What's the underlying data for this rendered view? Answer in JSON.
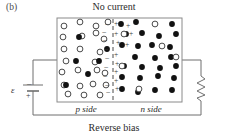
{
  "figure": {
    "panel_label": "(b)",
    "title": "No current",
    "caption": "Reverse bias",
    "p_side_label": "p side",
    "n_side_label": "n side",
    "emf_symbol": "ε",
    "emf_terminal_top": "–",
    "emf_terminal_bottom": "+",
    "colors": {
      "ink": "#231f20",
      "line": "#6f6f6f",
      "box_border": "#8a8a8a",
      "fill_circle": "#111111",
      "open_circle_stroke": "#4a4a4a",
      "background": "#ffffff"
    }
  },
  "box": {
    "x": 57,
    "y": 18,
    "width": 125,
    "height": 84,
    "junction_x": 113
  },
  "depletion": {
    "minus_sign": "–",
    "plus_sign": "+",
    "minus_positions": [
      [
        107,
        26
      ],
      [
        104,
        34
      ],
      [
        105,
        42
      ],
      [
        106,
        51
      ],
      [
        107,
        60
      ],
      [
        106,
        69
      ],
      [
        105,
        78
      ],
      [
        107,
        87
      ],
      [
        108,
        94
      ]
    ],
    "plus_positions": [
      [
        116,
        26
      ],
      [
        128,
        28
      ],
      [
        116,
        36
      ],
      [
        131,
        36
      ],
      [
        118,
        45
      ],
      [
        127,
        47
      ],
      [
        116,
        57
      ],
      [
        117,
        66
      ],
      [
        116,
        74
      ],
      [
        116,
        83
      ],
      [
        117,
        91
      ]
    ]
  },
  "p_side": {
    "open_circles": [
      [
        64,
        26
      ],
      [
        80,
        22
      ],
      [
        96,
        26
      ],
      [
        108,
        22
      ],
      [
        63,
        37
      ],
      [
        82,
        36
      ],
      [
        96,
        33
      ],
      [
        104,
        39
      ],
      [
        64,
        49
      ],
      [
        80,
        49
      ],
      [
        100,
        52
      ],
      [
        66,
        61
      ],
      [
        95,
        62
      ],
      [
        62,
        72
      ],
      [
        78,
        70
      ],
      [
        97,
        70
      ],
      [
        105,
        73
      ],
      [
        64,
        85
      ],
      [
        80,
        86
      ],
      [
        93,
        84
      ],
      [
        106,
        85
      ],
      [
        68,
        94
      ],
      [
        84,
        95
      ],
      [
        100,
        95
      ]
    ],
    "filled_circles": [
      [
        79,
        37
      ],
      [
        107,
        49
      ],
      [
        76,
        61
      ],
      [
        88,
        74
      ],
      [
        66,
        85
      ],
      [
        99,
        61
      ]
    ]
  },
  "n_side": {
    "filled_circles": [
      [
        121,
        24
      ],
      [
        136,
        22
      ],
      [
        172,
        24
      ],
      [
        126,
        34
      ],
      [
        142,
        33
      ],
      [
        159,
        36
      ],
      [
        176,
        34
      ],
      [
        122,
        45
      ],
      [
        138,
        46
      ],
      [
        152,
        45
      ],
      [
        170,
        47
      ],
      [
        135,
        57
      ],
      [
        155,
        58
      ],
      [
        171,
        57
      ],
      [
        124,
        66
      ],
      [
        142,
        67
      ],
      [
        160,
        68
      ],
      [
        176,
        66
      ],
      [
        122,
        77
      ],
      [
        140,
        78
      ],
      [
        158,
        76
      ],
      [
        174,
        78
      ],
      [
        122,
        89
      ],
      [
        138,
        92
      ],
      [
        155,
        90
      ],
      [
        172,
        90
      ]
    ],
    "open_circles": [
      [
        124,
        34
      ],
      [
        155,
        24
      ],
      [
        162,
        46
      ],
      [
        122,
        66
      ],
      [
        139,
        89
      ],
      [
        176,
        57
      ]
    ]
  },
  "circuit": {
    "left_wire_x": 33,
    "right_wire_x": 201,
    "top_wire_y": 60,
    "bottom_wire_y": 115,
    "battery_y": 88,
    "resistor_name": "resistor",
    "battery_name": "battery-emf"
  }
}
